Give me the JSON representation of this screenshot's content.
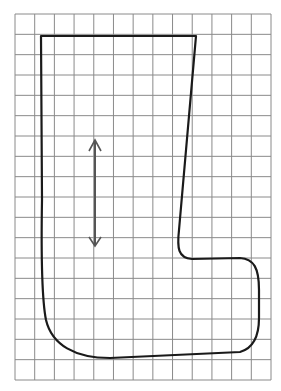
{
  "diagram": {
    "type": "grid-pattern-outline",
    "grid": {
      "columns": 13,
      "rows": 18,
      "left": 15,
      "top": 14,
      "right": 271,
      "bottom": 380,
      "line_color": "#8a8a8a"
    },
    "outline": {
      "stroke_color": "#1a1a1a",
      "stroke_width": 2.2
    },
    "arrow": {
      "x": 95,
      "y1": 140,
      "y2": 246,
      "direction": "vertical-double-headed",
      "color": "#555555"
    },
    "colors": {
      "background": "#ffffff",
      "grid": "#8a8a8a",
      "outline": "#1a1a1a",
      "arrow": "#555555"
    }
  }
}
